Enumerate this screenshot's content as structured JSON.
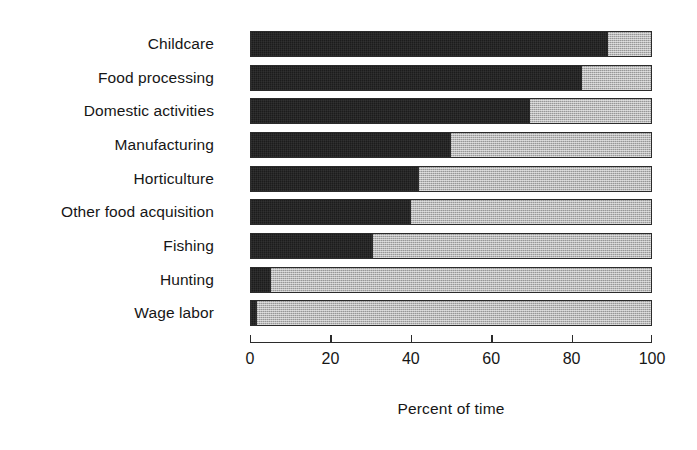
{
  "chart_data": {
    "type": "bar",
    "orientation": "horizontal",
    "stacked": true,
    "normalized_percent": true,
    "title": "",
    "subtitle": "",
    "xlabel": "Percent of time",
    "ylabel": "",
    "xlim": [
      0,
      100
    ],
    "xticks": [
      0,
      20,
      40,
      60,
      80,
      100
    ],
    "xtick_labels": [
      "0",
      "20",
      "40",
      "60",
      "80",
      "100"
    ],
    "grid": false,
    "legend": "none",
    "categories": [
      "Childcare",
      "Food processing",
      "Domestic activities",
      "Manufacturing",
      "Horticulture",
      "Other food acquisition",
      "Fishing",
      "Hunting",
      "Wage labor"
    ],
    "series": [
      {
        "name": "dark-segment",
        "color": "#1c1c1c",
        "values": [
          89.5,
          83,
          70,
          50,
          42,
          40,
          30.5,
          5,
          1.5
        ]
      },
      {
        "name": "light-segment",
        "color": "#b9b9b9",
        "values": [
          10.5,
          17,
          30,
          50,
          58,
          60,
          69.5,
          95,
          98.5
        ]
      }
    ]
  },
  "axis": {
    "title": "Percent of time"
  }
}
